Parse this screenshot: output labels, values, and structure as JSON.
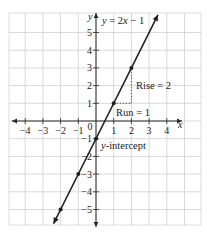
{
  "chart_data": {
    "type": "line",
    "title": "y = 2x − 1",
    "xlabel": "x",
    "ylabel": "y",
    "xlim": [
      -5,
      6
    ],
    "ylim": [
      -6,
      6
    ],
    "x_ticks": [
      -4,
      -3,
      -2,
      -1,
      0,
      1,
      2,
      3,
      4
    ],
    "x_tick_labels": [
      "−4",
      "−3",
      "−2",
      "−1",
      "0",
      "1",
      "2",
      "3",
      "4"
    ],
    "y_ticks": [
      -5,
      -4,
      -3,
      -2,
      -1,
      1,
      2,
      3,
      4,
      5
    ],
    "y_tick_labels": [
      "−5",
      "−4",
      "−3",
      "−2",
      "−1",
      "1",
      "2",
      "3",
      "4",
      "5"
    ],
    "grid": true,
    "series": [
      {
        "name": "y = 2x − 1",
        "equation": "y = 2x − 1",
        "slope": 2,
        "intercept": -1,
        "line_x_range": [
          -2.4,
          3.5
        ],
        "marked_points": [
          {
            "x": -2,
            "y": -5
          },
          {
            "x": -1,
            "y": -3
          },
          {
            "x": 0,
            "y": -1
          },
          {
            "x": 1,
            "y": 1
          },
          {
            "x": 2,
            "y": 3
          }
        ]
      }
    ],
    "annotations": [
      {
        "text": "Rise = 2",
        "type": "vertical-dashed",
        "from": {
          "x": 2,
          "y": 1
        },
        "to": {
          "x": 2,
          "y": 3
        }
      },
      {
        "text": "Run = 1",
        "type": "horizontal-dashed",
        "from": {
          "x": 1,
          "y": 1
        },
        "to": {
          "x": 2,
          "y": 1
        }
      },
      {
        "text": "y-intercept",
        "point": {
          "x": 0,
          "y": -1
        }
      }
    ]
  },
  "labels": {
    "equation_y": "y",
    "equation_rest": " = 2",
    "equation_x": "x",
    "equation_tail": " − 1",
    "rise": "Rise = 2",
    "run": "Run = 1",
    "intercept_y": "y",
    "intercept_rest": "-intercept",
    "axis_x": "x",
    "axis_y": "y"
  }
}
